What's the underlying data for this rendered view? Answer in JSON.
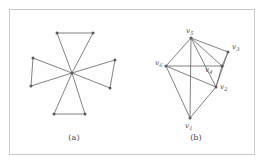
{
  "figure": {
    "background_color": "#ffffff",
    "frame_color": "#c9c9c9",
    "edge_color": "#6b6b6b",
    "node_color": "#5a5a5a",
    "label_color": "#4a4a4a",
    "panels": [
      {
        "id": "a",
        "caption": "(a)",
        "caption_x": 74,
        "caption_y": 140,
        "type": "windmill-graph",
        "description": "friendship/windmill graph: four triangles sharing one central hub vertex",
        "nodes": [
          {
            "name": "hub",
            "x": 72,
            "y": 73
          },
          {
            "name": "t1a",
            "x": 57,
            "y": 33
          },
          {
            "name": "t1b",
            "x": 93,
            "y": 33
          },
          {
            "name": "t2a",
            "x": 115,
            "y": 60
          },
          {
            "name": "t2b",
            "x": 110,
            "y": 88
          },
          {
            "name": "t3a",
            "x": 85,
            "y": 114
          },
          {
            "name": "t3b",
            "x": 54,
            "y": 114
          },
          {
            "name": "t4a",
            "x": 31,
            "y": 86
          },
          {
            "name": "t4b",
            "x": 33,
            "y": 58
          }
        ],
        "edges": [
          [
            "hub",
            "t1a"
          ],
          [
            "hub",
            "t1b"
          ],
          [
            "t1a",
            "t1b"
          ],
          [
            "hub",
            "t2a"
          ],
          [
            "hub",
            "t2b"
          ],
          [
            "t2a",
            "t2b"
          ],
          [
            "hub",
            "t3a"
          ],
          [
            "hub",
            "t3b"
          ],
          [
            "t3a",
            "t3b"
          ],
          [
            "hub",
            "t4a"
          ],
          [
            "hub",
            "t4b"
          ],
          [
            "t4a",
            "t4b"
          ]
        ]
      },
      {
        "id": "b",
        "caption": "(b)",
        "caption_x": 196,
        "caption_y": 140,
        "type": "labeled-graph",
        "description": "six-vertex labeled graph v1..v6",
        "nodes": [
          {
            "name": "v5",
            "label": "v",
            "sub": "5",
            "x": 191,
            "y": 38,
            "lx": 186,
            "ly": 33
          },
          {
            "name": "v3",
            "label": "v",
            "sub": "3",
            "x": 228,
            "y": 52,
            "lx": 232,
            "ly": 49
          },
          {
            "name": "v6",
            "label": "v",
            "sub": "6",
            "x": 166,
            "y": 66,
            "lx": 155,
            "ly": 65
          },
          {
            "name": "v4",
            "label": "v",
            "sub": "4",
            "x": 222,
            "y": 66,
            "lx": 205,
            "ly": 72
          },
          {
            "name": "v2",
            "label": "v",
            "sub": "2",
            "x": 216,
            "y": 87,
            "lx": 220,
            "ly": 89
          },
          {
            "name": "v1",
            "label": "v",
            "sub": "1",
            "x": 190,
            "y": 118,
            "lx": 185,
            "ly": 128
          }
        ],
        "edges": [
          [
            "v5",
            "v3"
          ],
          [
            "v5",
            "v6"
          ],
          [
            "v5",
            "v4"
          ],
          [
            "v5",
            "v2"
          ],
          [
            "v5",
            "v1"
          ],
          [
            "v3",
            "v4"
          ],
          [
            "v3",
            "v2"
          ],
          [
            "v6",
            "v4"
          ],
          [
            "v6",
            "v2"
          ],
          [
            "v6",
            "v1"
          ],
          [
            "v4",
            "v2"
          ],
          [
            "v2",
            "v1"
          ]
        ]
      }
    ]
  }
}
